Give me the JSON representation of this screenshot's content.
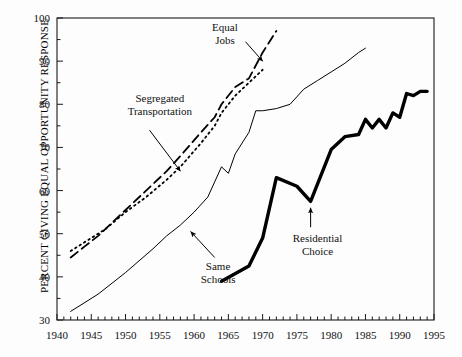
{
  "chart_data": {
    "type": "line",
    "title": "",
    "subtitle": "",
    "xlabel": "",
    "ylabel": "PERCENT GIVING EQUAL OPPORTUNITY RESPONSE",
    "xlim": [
      1940,
      1995
    ],
    "ylim": [
      30,
      100
    ],
    "xticks": [
      1940,
      1945,
      1950,
      1955,
      1960,
      1965,
      1970,
      1975,
      1980,
      1985,
      1990,
      1995
    ],
    "yticks": [
      30,
      40,
      50,
      60,
      70,
      80,
      90,
      100
    ],
    "xtick_labels": [
      "1940",
      "1945",
      "1950",
      "1955",
      "1960",
      "1965",
      "1970",
      "1975",
      "1980",
      "1985",
      "1990",
      "1995"
    ],
    "ytick_labels": [
      "30",
      "40",
      "50",
      "60",
      "70",
      "80",
      "90",
      "100"
    ],
    "minor_tick_interval": 1,
    "grid": false,
    "legend": "none",
    "legend_position": "inline-annotations",
    "series": [
      {
        "name": "Equal Jobs",
        "style": "long-dash",
        "width": 1.8,
        "color": "#000000",
        "x": [
          1942,
          1944,
          1946,
          1947,
          1950,
          1953,
          1956,
          1958,
          1961,
          1963,
          1964,
          1966,
          1968,
          1970,
          1972
        ],
        "values": [
          44.5,
          47.0,
          49.5,
          51.0,
          55.5,
          60.0,
          64.5,
          68.0,
          73.5,
          77.0,
          80.0,
          84.0,
          86.0,
          92.0,
          97.0
        ]
      },
      {
        "name": "Segregated Transportation",
        "style": "dotted",
        "width": 1.8,
        "color": "#000000",
        "x": [
          1942,
          1944,
          1946,
          1947,
          1950,
          1953,
          1956,
          1958,
          1961,
          1963,
          1964,
          1966,
          1968,
          1970
        ],
        "values": [
          46.0,
          48.0,
          50.0,
          51.0,
          55.0,
          58.5,
          62.5,
          65.5,
          71.0,
          75.0,
          78.0,
          82.0,
          85.0,
          88.0
        ]
      },
      {
        "name": "Same Schools",
        "style": "solid-thin",
        "width": 1.0,
        "color": "#000000",
        "x": [
          1942,
          1946,
          1950,
          1954,
          1956,
          1958,
          1960,
          1962,
          1963,
          1964,
          1965,
          1966,
          1968,
          1969,
          1970,
          1972,
          1974,
          1976,
          1978,
          1980,
          1982,
          1984,
          1985
        ],
        "values": [
          32.0,
          36.0,
          41.0,
          46.5,
          49.5,
          52.0,
          55.0,
          58.5,
          62.0,
          65.5,
          64.0,
          68.5,
          73.5,
          78.5,
          78.5,
          79.0,
          80.0,
          83.5,
          85.5,
          87.5,
          89.5,
          92.0,
          93.0
        ]
      },
      {
        "name": "Residential Choice",
        "style": "solid-thick",
        "width": 3.4,
        "color": "#000000",
        "x": [
          1964,
          1968,
          1970,
          1972,
          1975,
          1977,
          1980,
          1982,
          1984,
          1985,
          1986,
          1987,
          1988,
          1989,
          1990,
          1991,
          1992,
          1993,
          1994
        ],
        "values": [
          39.0,
          42.5,
          49.0,
          63.0,
          61.0,
          57.5,
          69.5,
          72.5,
          73.0,
          76.5,
          74.5,
          76.5,
          74.5,
          78.0,
          77.0,
          82.5,
          82.0,
          83.0,
          83.0
        ]
      }
    ],
    "annotations": [
      {
        "id": "equal-jobs",
        "label_lines": [
          "Equal",
          "Jobs"
        ],
        "label_x": 1964.5,
        "label_y": 97.0,
        "target_series": "Equal Jobs",
        "arrow_from": [
          1967.5,
          94.5
        ],
        "arrow_to": [
          1970.0,
          90.0
        ]
      },
      {
        "id": "segregated-transportation",
        "label_lines": [
          "Segregated",
          "Transportation"
        ],
        "label_x": 1955.0,
        "label_y": 80.5,
        "target_series": "Segregated Transportation",
        "arrow_from": [
          1953.5,
          74.0
        ],
        "arrow_to": [
          1958.0,
          64.5
        ]
      },
      {
        "id": "same-schools",
        "label_lines": [
          "Same",
          "Schools"
        ],
        "label_x": 1963.5,
        "label_y": 41.5,
        "target_series": "Same Schools",
        "arrow_from": [
          1963.0,
          44.5
        ],
        "arrow_to": [
          1959.5,
          50.5
        ]
      },
      {
        "id": "residential-choice",
        "label_lines": [
          "Residential",
          "Choice"
        ],
        "label_x": 1978.0,
        "label_y": 48.0,
        "target_series": "Residential Choice",
        "arrow_from": [
          1977.0,
          51.5
        ],
        "arrow_to": [
          1977.0,
          56.0
        ]
      }
    ]
  }
}
